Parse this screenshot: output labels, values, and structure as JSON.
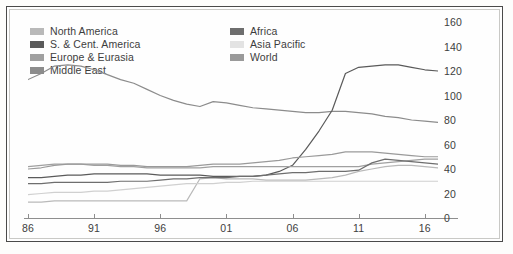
{
  "legend": {
    "left_column": [
      {
        "label": "North America",
        "color": "#b9b9b9",
        "swatch": "legend-swatch-north-america"
      },
      {
        "label": "S. & Cent. America",
        "color": "#5a5a5a",
        "swatch": "legend-swatch-s-cent-america"
      },
      {
        "label": "Europe & Eurasia",
        "color": "#a0a0a0",
        "swatch": "legend-swatch-europe-eurasia"
      },
      {
        "label": "Middle East",
        "color": "#8c8c8c",
        "swatch": "legend-swatch-middle-east"
      }
    ],
    "right_column": [
      {
        "label": "Africa",
        "color": "#6e6e6e",
        "swatch": "legend-swatch-africa"
      },
      {
        "label": "Asia Pacific",
        "color": "#e3e3e3",
        "swatch": "legend-swatch-asia-pacific"
      },
      {
        "label": "World",
        "color": "#9a9a9a",
        "swatch": "legend-swatch-world"
      }
    ]
  },
  "axes": {
    "x_ticks": [
      "86",
      "91",
      "96",
      "01",
      "06",
      "11",
      "16"
    ],
    "y_ticks": [
      "160",
      "140",
      "120",
      "100",
      "80",
      "60",
      "40",
      "20",
      "0"
    ],
    "x_min": 1986,
    "x_max": 2017,
    "y_min": 0,
    "y_max": 160
  },
  "chart_data": {
    "type": "line",
    "title": "",
    "subtitle": "",
    "xlabel": "",
    "ylabel": "",
    "xlim": [
      1986,
      2017
    ],
    "ylim": [
      0,
      160
    ],
    "grid": false,
    "legend_position": "top-left",
    "x": [
      1986,
      1987,
      1988,
      1989,
      1990,
      1991,
      1992,
      1993,
      1994,
      1995,
      1996,
      1997,
      1998,
      1999,
      2000,
      2001,
      2002,
      2003,
      2004,
      2005,
      2006,
      2007,
      2008,
      2009,
      2010,
      2011,
      2012,
      2013,
      2014,
      2015,
      2016,
      2017
    ],
    "series": [
      {
        "name": "Middle East",
        "color": "#8c8c8c",
        "values": [
          113,
          118,
          124,
          125,
          124,
          121,
          117,
          113,
          110,
          105,
          100,
          96,
          93,
          91,
          95,
          94,
          92,
          90,
          89,
          88,
          87,
          86,
          86,
          87,
          87,
          86,
          85,
          83,
          82,
          80,
          79,
          78
        ]
      },
      {
        "name": "S. & Cent. America",
        "color": "#5a5a5a",
        "values": [
          33,
          33,
          34,
          35,
          35,
          36,
          36,
          36,
          36,
          36,
          35,
          35,
          35,
          35,
          34,
          34,
          34,
          34,
          35,
          38,
          43,
          56,
          71,
          88,
          118,
          123,
          124,
          125,
          125,
          123,
          121,
          120
        ]
      },
      {
        "name": "North America",
        "color": "#b9b9b9",
        "values": [
          13,
          13,
          14,
          14,
          14,
          14,
          14,
          14,
          14,
          14,
          14,
          14,
          14,
          32,
          33,
          32,
          32,
          32,
          31,
          31,
          31,
          31,
          32,
          33,
          35,
          38,
          40,
          42,
          43,
          43,
          42,
          41
        ]
      },
      {
        "name": "Europe & Eurasia",
        "color": "#a0a0a0",
        "values": [
          42,
          43,
          44,
          44,
          44,
          43,
          43,
          42,
          42,
          41,
          41,
          41,
          41,
          41,
          42,
          42,
          42,
          42,
          42,
          42,
          42,
          42,
          42,
          42,
          42,
          42,
          44,
          45,
          46,
          47,
          48,
          48
        ]
      },
      {
        "name": "Africa",
        "color": "#6e6e6e",
        "values": [
          28,
          28,
          29,
          29,
          29,
          29,
          29,
          30,
          30,
          30,
          31,
          32,
          32,
          33,
          33,
          33,
          34,
          34,
          35,
          36,
          37,
          37,
          38,
          38,
          38,
          39,
          45,
          48,
          47,
          46,
          45,
          44
        ]
      },
      {
        "name": "Asia Pacific",
        "color": "#d0d0d0",
        "values": [
          19,
          20,
          21,
          21,
          21,
          22,
          22,
          23,
          24,
          25,
          26,
          27,
          28,
          28,
          28,
          29,
          29,
          30,
          30,
          30,
          30,
          30,
          30,
          30,
          30,
          30,
          30,
          30,
          30,
          30,
          30,
          30
        ]
      },
      {
        "name": "World",
        "color": "#9a9a9a",
        "values": [
          40,
          41,
          43,
          44,
          44,
          44,
          44,
          43,
          43,
          42,
          42,
          42,
          42,
          43,
          44,
          44,
          44,
          45,
          46,
          47,
          49,
          50,
          51,
          52,
          54,
          54,
          54,
          53,
          52,
          51,
          50,
          50
        ]
      }
    ]
  }
}
